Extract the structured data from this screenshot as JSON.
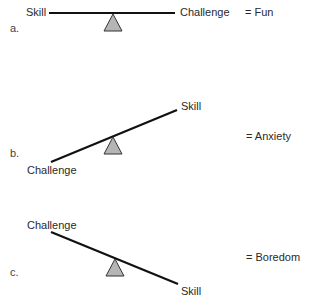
{
  "diagram": {
    "colors": {
      "beam": "#111111",
      "fulcrum_fill": "#b5b5b5",
      "fulcrum_stroke": "#333333"
    },
    "panels": [
      {
        "label": "a.",
        "left_end": "Skill",
        "right_end": "Challenge",
        "state": "balanced",
        "result": "=  Fun"
      },
      {
        "label": "b.",
        "left_end": "Challenge",
        "right_end": "Skill",
        "state": "tilted, challenge side down",
        "result": "=  Anxiety"
      },
      {
        "label": "c.",
        "left_end": "Challenge",
        "right_end": "Skill",
        "state": "tilted, skill side down",
        "result": "=  Boredom"
      }
    ]
  }
}
